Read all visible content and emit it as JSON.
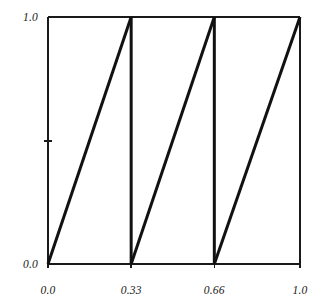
{
  "figure": {
    "background_color": "#ffffff",
    "frame_color": "#1a1a1a",
    "line_color": "#111111",
    "width": 318,
    "height": 306
  },
  "axes": {
    "left_px": 48,
    "right_px": 300,
    "top_px": 17,
    "bottom_px": 264,
    "x_ticks": [
      {
        "value": 0.0,
        "label": "0.0",
        "labeled": true
      },
      {
        "value": 0.33,
        "label": "0.33",
        "labeled": true
      },
      {
        "value": 0.66,
        "label": "0.66",
        "labeled": true
      },
      {
        "value": 1.0,
        "label": "1.0",
        "labeled": true
      }
    ],
    "y_ticks": [
      {
        "value": 0.0,
        "label": "0.0",
        "labeled": true
      },
      {
        "value": 0.5,
        "label": "",
        "labeled": false
      },
      {
        "value": 1.0,
        "label": "1.0",
        "labeled": true
      }
    ]
  },
  "chart_data": {
    "type": "line",
    "title": "",
    "subtitle": "",
    "xlabel": "",
    "ylabel": "",
    "xlim": [
      0.0,
      1.0
    ],
    "ylim": [
      0.0,
      1.0
    ],
    "grid": false,
    "legend": null,
    "legend_position": "none",
    "xticks": [
      0.0,
      0.33,
      0.66,
      1.0
    ],
    "xticklabels": [
      "0.0",
      "0.33",
      "0.66",
      "1.0"
    ],
    "yticks": [
      0.0,
      0.5,
      1.0
    ],
    "yticklabels": [
      "0.0",
      "",
      "1.0"
    ],
    "series": [
      {
        "name": "sawtooth",
        "color": "#111111",
        "linewidth": 3,
        "segments": [
          {
            "x": [
              0.0,
              0.33
            ],
            "y": [
              0.0,
              1.0
            ]
          },
          {
            "x": [
              0.33,
              0.33
            ],
            "y": [
              1.0,
              0.0
            ]
          },
          {
            "x": [
              0.33,
              0.66
            ],
            "y": [
              0.0,
              1.0
            ]
          },
          {
            "x": [
              0.66,
              0.66
            ],
            "y": [
              1.0,
              0.0
            ]
          },
          {
            "x": [
              0.66,
              1.0
            ],
            "y": [
              0.0,
              1.0
            ]
          }
        ],
        "x": [
          0.0,
          0.33,
          0.33,
          0.66,
          0.66,
          1.0
        ],
        "y": [
          0.0,
          1.0,
          0.0,
          1.0,
          0.0,
          1.0
        ]
      }
    ]
  }
}
